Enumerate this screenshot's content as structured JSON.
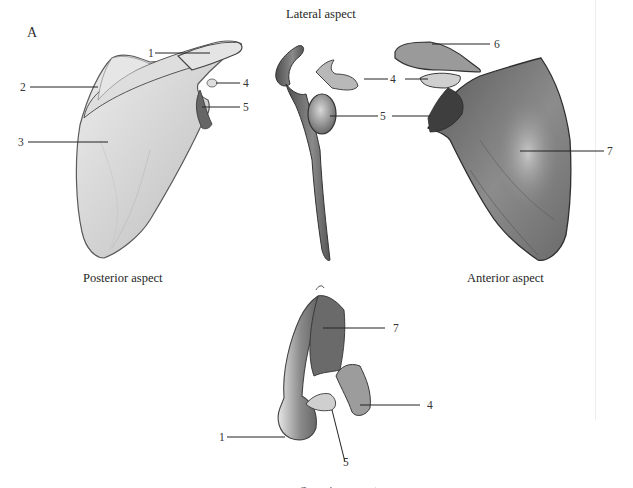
{
  "figure": {
    "panel_letter": "A",
    "views": {
      "lateral": {
        "caption": "Lateral aspect"
      },
      "posterior": {
        "caption": "Posterior aspect"
      },
      "anterior": {
        "caption": "Anterior aspect"
      },
      "superior": {
        "caption": "Superior aspect"
      }
    },
    "labels": {
      "posterior": [
        "1",
        "2",
        "3",
        "4",
        "5"
      ],
      "lateral": [
        "4",
        "5"
      ],
      "anterior": [
        "6",
        "4",
        "5",
        "7"
      ],
      "superior": [
        "7",
        "4",
        "1",
        "5"
      ]
    }
  },
  "colors": {
    "bone_light": "#e8e8e8",
    "bone_mid": "#a8a8a8",
    "bone_dark": "#4a4a4a",
    "outline": "#3a3a3a",
    "leader": "#222222"
  }
}
